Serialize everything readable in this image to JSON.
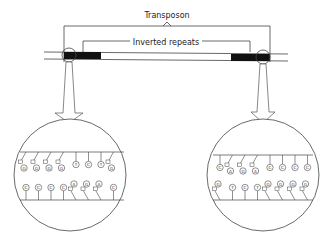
{
  "labels": {
    "transposon": "Transposon",
    "inverted_repeats": "Inverted repeats"
  },
  "left_detail": {
    "top_strand": [
      "G",
      "G",
      "G",
      "G",
      "T",
      "C",
      "T",
      "G"
    ],
    "bottom_strand": [
      "C",
      "C",
      "C",
      "C",
      "A",
      "G",
      "A",
      "C"
    ]
  },
  "right_detail": {
    "top_strand": [
      "C",
      "A",
      "G",
      "A",
      "C",
      "C",
      "C",
      "C"
    ],
    "bottom_strand": [
      "G",
      "T",
      "C",
      "T",
      "G",
      "G",
      "G",
      "G"
    ]
  },
  "colors": {
    "line": "#333333",
    "repeat_fill": "#111111"
  }
}
